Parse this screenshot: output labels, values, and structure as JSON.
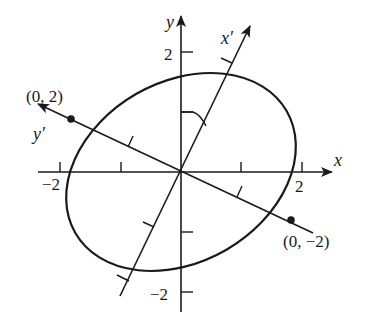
{
  "diagram": {
    "type": "rotated-ellipse-axes",
    "colors": {
      "ink": "#1a1a1a",
      "background": "#ffffff"
    },
    "axes": {
      "x": {
        "label": "x",
        "tick_labels": [
          "−2",
          "2"
        ]
      },
      "y": {
        "label": "y",
        "tick_labels": [
          "2",
          "−2"
        ]
      },
      "x_prime": {
        "label": "x′"
      },
      "y_prime": {
        "label": "y′"
      }
    },
    "points": [
      {
        "label": "(0, 2)"
      },
      {
        "label": "(0, −2)"
      }
    ],
    "angle_marker": "arc between y-axis and x′-axis",
    "ellipse": "ellipse centered at origin, major axis along y′"
  }
}
